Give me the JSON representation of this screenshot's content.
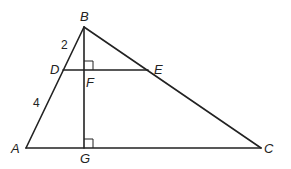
{
  "diagram": {
    "type": "geometry-triangle",
    "points": {
      "A": {
        "label": "A",
        "x": 26,
        "y": 148
      },
      "B": {
        "label": "B",
        "x": 84,
        "y": 27
      },
      "C": {
        "label": "C",
        "x": 261,
        "y": 148
      },
      "D": {
        "label": "D",
        "x": 63,
        "y": 70
      },
      "E": {
        "label": "E",
        "x": 148,
        "y": 70
      },
      "F": {
        "label": "F",
        "x": 84,
        "y": 70
      },
      "G": {
        "label": "G",
        "x": 84,
        "y": 148
      }
    },
    "segments": [
      "AB",
      "BC",
      "AC",
      "DE",
      "BG"
    ],
    "right_angles": [
      "F",
      "G"
    ],
    "measurements": {
      "BD": "2",
      "DA": "4"
    }
  }
}
